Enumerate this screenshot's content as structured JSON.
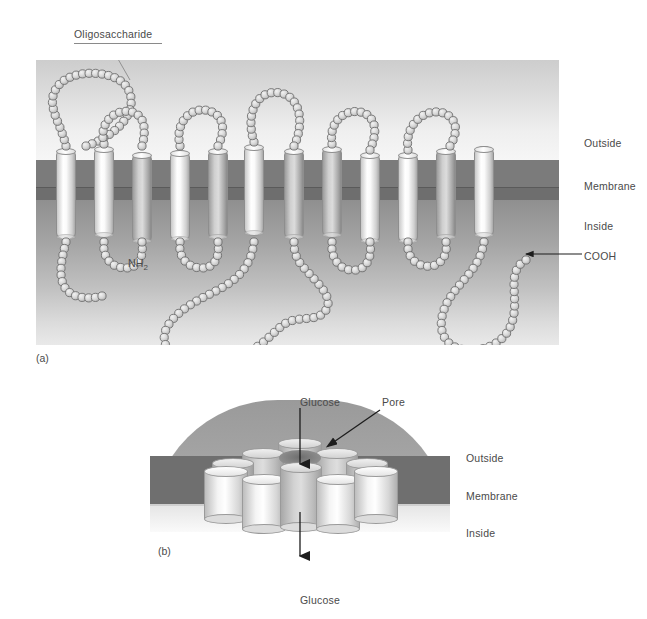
{
  "figure": {
    "panels": [
      {
        "tag": "(a)",
        "name": "glucose-transporter-topology",
        "labels": {
          "oligosaccharide": "Oligosaccharide",
          "nh2": "NH",
          "nh2_sub": "2",
          "cooh": "COOH",
          "outside": "Outside",
          "membrane": "Membrane",
          "inside": "Inside"
        },
        "helix_count": 12
      },
      {
        "tag": "(b)",
        "name": "pore-cross-section",
        "labels": {
          "glucose_top": "Glucose",
          "pore": "Pore",
          "glucose_bottom": "Glucose",
          "outside": "Outside",
          "membrane": "Membrane",
          "inside": "Inside"
        },
        "cylinder_count": 10
      }
    ],
    "colors": {
      "membrane_band": "#7b7b7b",
      "membrane_slab": "#6f6f6f",
      "outside_top": "#cdcdcd",
      "inside_gradient": "#8f8f8f",
      "bead_fill": "#d8d8d8",
      "bead_stroke": "#6d6d6d",
      "text": "#4a4a4a",
      "arrow": "#1d1d1d"
    }
  }
}
